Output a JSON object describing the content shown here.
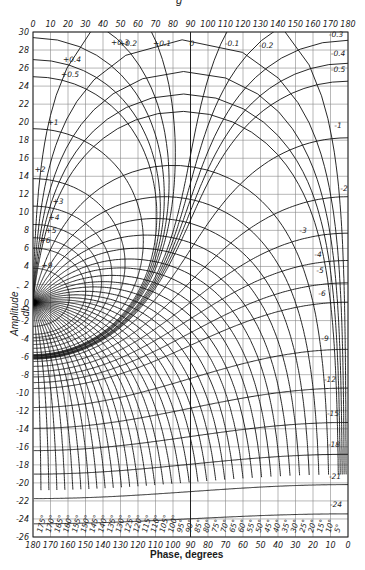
{
  "caption": "g",
  "chart_data": {
    "type": "line",
    "xlabel": "Phase, degrees",
    "ylabel": "Amplitude , db",
    "x_top_ticks": [
      0,
      10,
      20,
      30,
      40,
      50,
      60,
      70,
      80,
      90,
      100,
      110,
      120,
      130,
      140,
      150,
      160,
      170,
      180
    ],
    "x_bottom_ticks": [
      180,
      170,
      160,
      150,
      140,
      130,
      120,
      110,
      100,
      90,
      80,
      70,
      60,
      50,
      40,
      30,
      20,
      10,
      0
    ],
    "y_ticks": [
      30,
      28,
      26,
      24,
      22,
      20,
      18,
      16,
      14,
      12,
      10,
      8,
      6,
      4,
      2,
      0,
      -2,
      -4,
      -6,
      -8,
      -10,
      -12,
      -14,
      -16,
      -18,
      -20,
      -22,
      -24,
      -26
    ],
    "xlim": [
      0,
      180
    ],
    "ylim": [
      -26,
      30
    ],
    "grid": true,
    "m_contours_db": [
      0.1,
      0.2,
      0.3,
      0.4,
      0.5,
      1,
      2,
      3,
      4,
      5,
      6,
      9,
      -0.1,
      -0.2,
      -0.3,
      -0.4,
      -0.5,
      -1,
      -2,
      -3,
      -4,
      -5,
      -6,
      -9,
      -12,
      -15,
      -18,
      -21,
      -24
    ],
    "m_contour_labels": [
      "+0.1",
      "+0.2",
      "+0.3",
      "+0.4",
      "+0.5",
      "+1",
      "+2",
      "+3",
      "+4",
      "+5",
      "+6",
      "+9",
      "0",
      "-0.1",
      "-0.2",
      "-0.3",
      "-0.4",
      "-0.5",
      "-1",
      "-2",
      "-3",
      "-4",
      "-5",
      "-6",
      "-9",
      "-12",
      "-15",
      "-18",
      "-21",
      "-24"
    ],
    "n_contours_deg": [
      -1,
      -2,
      -3,
      -4,
      -5,
      -10,
      -15,
      -20,
      -25,
      -30,
      -35,
      -40,
      -45,
      -50,
      -55,
      -60,
      -65,
      -70,
      -75,
      -80,
      -85,
      -90,
      -95,
      -100,
      -105,
      -110,
      -115,
      -120,
      -125,
      -130,
      -135,
      -140,
      -145,
      -150,
      -155,
      -160,
      -165,
      -170,
      -175
    ],
    "bottom_phase_labels": [
      "175°",
      "170°",
      "165°",
      "160°",
      "155°",
      "150°",
      "145°",
      "140°",
      "135°",
      "130°",
      "125°",
      "120°",
      "115°",
      "110°",
      "105°",
      "100°",
      "95°",
      "90°",
      "85°",
      "80°",
      "75°",
      "70°",
      "65°",
      "60°",
      "55°",
      "50°",
      "45°",
      "40°",
      "35°",
      "30°",
      "25°",
      "20°",
      "15°",
      "10°",
      "5°"
    ]
  },
  "labels": {
    "xlabel": "Phase, degrees",
    "ylabel": "Amplitude , db"
  }
}
